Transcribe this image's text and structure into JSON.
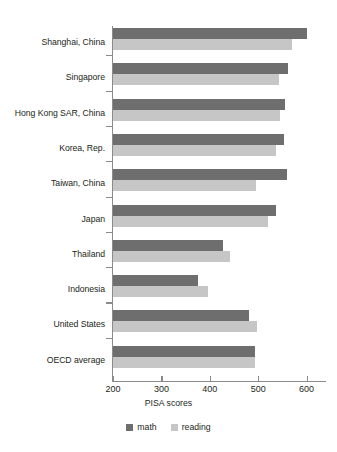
{
  "chart_data": {
    "type": "bar",
    "orientation": "horizontal",
    "title": "",
    "xlabel": "PISA scores",
    "ylabel": "",
    "xlim": [
      200,
      640
    ],
    "xticks": [
      200,
      300,
      400,
      500,
      600
    ],
    "xtick_labels": [
      "200",
      "300",
      "400",
      "500",
      "600"
    ],
    "grid": false,
    "legend_position": "bottom",
    "categories": [
      "Shanghai, China",
      "Singapore",
      "Hong Kong SAR, China",
      "Korea, Rep.",
      "Taiwan, China",
      "Japan",
      "Thailand",
      "Indonesia",
      "United States",
      "OECD average"
    ],
    "series": [
      {
        "name": "math",
        "color": "#6e6e6e",
        "values": [
          600,
          562,
          555,
          554,
          560,
          536,
          427,
          375,
          481,
          494
        ]
      },
      {
        "name": "reading",
        "color": "#c6c6c6",
        "values": [
          570,
          542,
          545,
          536,
          495,
          520,
          441,
          396,
          498,
          493
        ]
      }
    ]
  },
  "legend": {
    "items": [
      {
        "label": "math",
        "color": "#6e6e6e",
        "swatch": "square-swatch"
      },
      {
        "label": "reading",
        "color": "#c6c6c6",
        "swatch": "square-swatch"
      }
    ]
  },
  "axis": {
    "x_title": "PISA scores",
    "tick_labels": [
      "200",
      "300",
      "400",
      "500",
      "600"
    ]
  }
}
